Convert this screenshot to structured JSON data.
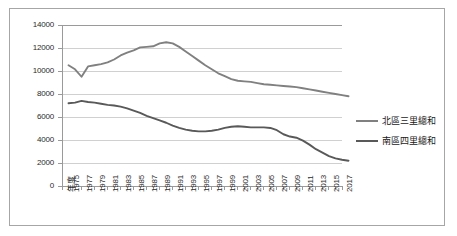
{
  "chart_data": {
    "type": "line",
    "title": "",
    "xlabel": "年度",
    "ylabel": "",
    "ylim": [
      0,
      14000
    ],
    "ytick_values": [
      0,
      2000,
      4000,
      6000,
      8000,
      10000,
      12000,
      14000
    ],
    "ytick_labels": [
      "0",
      "2000",
      "4000",
      "6000",
      "8000",
      "10000",
      "12000",
      "14000"
    ],
    "grid": true,
    "legend_position": "right",
    "axis_origin_label": "年度",
    "x": [
      1974,
      1975,
      1976,
      1977,
      1978,
      1979,
      1980,
      1981,
      1982,
      1983,
      1984,
      1985,
      1986,
      1987,
      1988,
      1989,
      1990,
      1991,
      1992,
      1993,
      1994,
      1995,
      1996,
      1997,
      1998,
      1999,
      2000,
      2001,
      2002,
      2003,
      2004,
      2005,
      2006,
      2007,
      2008,
      2009,
      2010,
      2011,
      2012,
      2013,
      2014,
      2015,
      2016,
      2017
    ],
    "categories": [
      "年度",
      "1975",
      "1976",
      "1977",
      "1978",
      "1979",
      "1980",
      "1981",
      "1982",
      "1983",
      "1984",
      "1985",
      "1986",
      "1987",
      "1988",
      "1989",
      "1990",
      "1991",
      "1992",
      "1993",
      "1994",
      "1995",
      "1996",
      "1997",
      "1998",
      "1999",
      "2000",
      "2001",
      "2002",
      "2003",
      "2004",
      "2005",
      "2006",
      "2007",
      "2008",
      "2009",
      "2010",
      "2011",
      "2012",
      "2013",
      "2014",
      "2015",
      "2016",
      "2017"
    ],
    "xtick_labels": [
      "年度",
      "1975",
      "1977",
      "1979",
      "1981",
      "1983",
      "1985",
      "1987",
      "1989",
      "1991",
      "1993",
      "1995",
      "1997",
      "1999",
      "2001",
      "2003",
      "2005",
      "2007",
      "2009",
      "2011",
      "2013",
      "2015",
      "2017"
    ],
    "series": [
      {
        "name": "北區三里總和",
        "color": "#808080",
        "values": [
          10500,
          10150,
          9500,
          10400,
          10500,
          10600,
          10750,
          11000,
          11350,
          11600,
          11800,
          12050,
          12100,
          12150,
          12400,
          12500,
          12400,
          12100,
          11700,
          11300,
          10900,
          10500,
          10150,
          9800,
          9550,
          9300,
          9150,
          9100,
          9050,
          8950,
          8850,
          8800,
          8750,
          8700,
          8650,
          8600,
          8500,
          8400,
          8300,
          8200,
          8100,
          8000,
          7900,
          7800
        ]
      },
      {
        "name": "南區四里總和",
        "color": "#595959",
        "values": [
          7200,
          7250,
          7400,
          7300,
          7250,
          7150,
          7050,
          7000,
          6900,
          6750,
          6550,
          6350,
          6100,
          5900,
          5700,
          5500,
          5250,
          5050,
          4900,
          4800,
          4750,
          4750,
          4800,
          4900,
          5050,
          5150,
          5200,
          5150,
          5100,
          5100,
          5100,
          5050,
          4850,
          4500,
          4300,
          4200,
          3950,
          3600,
          3200,
          2900,
          2600,
          2400,
          2280,
          2200
        ]
      }
    ]
  }
}
